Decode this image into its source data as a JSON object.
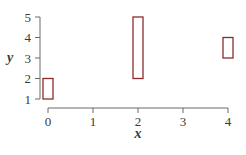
{
  "chart_data": {
    "type": "range-bar",
    "title": "",
    "xlabel": "x",
    "ylabel": "y",
    "xlim": [
      0,
      4
    ],
    "ylim": [
      1,
      5
    ],
    "xticks": [
      0,
      1,
      2,
      3,
      4
    ],
    "yticks": [
      1,
      2,
      3,
      4,
      5
    ],
    "grid": false,
    "legend": null,
    "bar_color": "#8b2c2c",
    "bars": [
      {
        "x": 0,
        "ymin": 1,
        "ymax": 2
      },
      {
        "x": 2,
        "ymin": 2,
        "ymax": 5
      },
      {
        "x": 4,
        "ymin": 3,
        "ymax": 4
      }
    ]
  },
  "axes": {
    "x_label": "x",
    "y_label": "y",
    "x_tick_labels": [
      "0",
      "1",
      "2",
      "3",
      "4"
    ],
    "y_tick_labels": [
      "1",
      "2",
      "3",
      "4",
      "5"
    ]
  }
}
